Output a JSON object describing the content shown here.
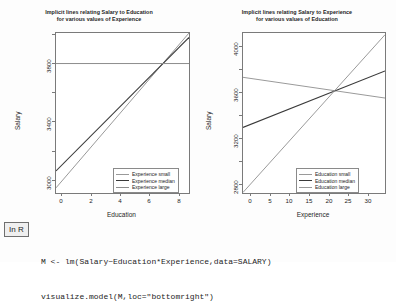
{
  "badge": {
    "label": "In R"
  },
  "code": {
    "lines": [
      "M <- lm(Salary~Education*Experience,data=SALARY)",
      "visualize.model(M,loc=\"bottomright\")"
    ]
  },
  "chart_data": [
    {
      "type": "line",
      "panel": "left",
      "title": "Implicit lines relating Salary to Education for various values of Experience",
      "title_line1": "Implicit lines relating Salary to Education",
      "title_line2": "for various values of Experience",
      "xlabel": "Education",
      "ylabel": "Salary",
      "xlim": [
        -0.45,
        8.6
      ],
      "ylim": [
        2870,
        3960
      ],
      "xticks": [
        0,
        2,
        4,
        6,
        8
      ],
      "yticks": [
        3000,
        3400,
        3800
      ],
      "ytick_labels": [
        "3000",
        "3400",
        "3800"
      ],
      "xtick_labels": [
        "0",
        "2",
        "4",
        "6",
        "8"
      ],
      "grid": false,
      "legend_position": "bottomright",
      "series": [
        {
          "name": "Experience small",
          "color": "#999999",
          "x": [
            -0.45,
            8.6
          ],
          "y": [
            2905,
            3960
          ]
        },
        {
          "name": "Experience median",
          "color": "#3a3a3a",
          "x": [
            -0.45,
            8.6
          ],
          "y": [
            3020,
            3930
          ]
        },
        {
          "name": "Experience large",
          "color": "#8d8d8d",
          "x": [
            -0.45,
            8.6
          ],
          "y": [
            3752,
            3752
          ]
        }
      ]
    },
    {
      "type": "line",
      "panel": "right",
      "title": "Implicit lines relating Salary to Experience for various values of Education",
      "title_line1": "Implicit lines relating Salary to Experience",
      "title_line2": "for various values of Education",
      "xlabel": "Experience",
      "ylabel": "Salary",
      "xlim": [
        -2.0,
        34.0
      ],
      "ylim": [
        2730,
        4120
      ],
      "xticks": [
        0,
        5,
        10,
        15,
        20,
        25,
        30
      ],
      "yticks": [
        2800,
        3200,
        3600,
        4000
      ],
      "ytick_labels": [
        "2800",
        "3200",
        "3600",
        "4000"
      ],
      "xtick_labels": [
        "0",
        "5",
        "10",
        "15",
        "20",
        "25",
        "30"
      ],
      "grid": false,
      "legend_position": "bottomright",
      "series": [
        {
          "name": "Education small",
          "color": "#9a9a9a",
          "x": [
            -2.0,
            34.0
          ],
          "y": [
            3735,
            3555
          ]
        },
        {
          "name": "Education median",
          "color": "#3a3a3a",
          "x": [
            -2.0,
            34.0
          ],
          "y": [
            3300,
            3790
          ]
        },
        {
          "name": "Education large",
          "color": "#9a9a9a",
          "x": [
            -2.0,
            34.0
          ],
          "y": [
            2735,
            4105
          ]
        }
      ]
    }
  ]
}
